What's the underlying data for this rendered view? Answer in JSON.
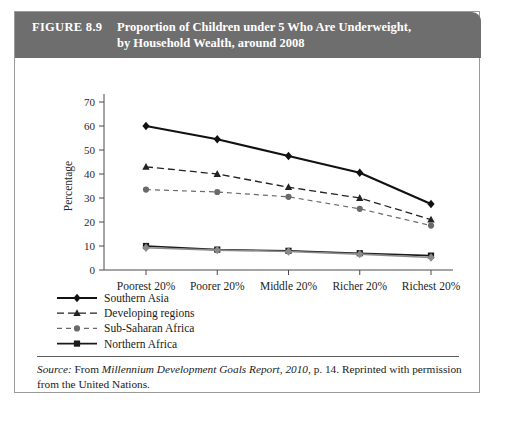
{
  "figure": {
    "number_label": "FIGURE 8.9",
    "title_line1": "Proportion of Children under 5 Who Are Underweight,",
    "title_line2": "by Household Wealth, around 2008",
    "header_bg": "#6e6e6e",
    "header_text_color": "#ffffff"
  },
  "source": {
    "prefix": "Source:",
    "text_before_italic": " From ",
    "italic_title": "Millennium Development Goals Report, 2010",
    "text_after": ", p. 14. Reprinted with permission from the United Nations."
  },
  "chart_data": {
    "type": "line",
    "title": "Proportion of Children under 5 Who Are Underweight, by Household Wealth, around 2008",
    "xlabel": "",
    "ylabel": "Percentage",
    "categories": [
      "Poorest 20%",
      "Poorer 20%",
      "Middle 20%",
      "Richer 20%",
      "Richest 20%"
    ],
    "ylim": [
      0,
      70
    ],
    "yticks": [
      0,
      10,
      20,
      30,
      40,
      50,
      60,
      70
    ],
    "ytick_labels": [
      "0",
      "10",
      "20",
      "30",
      "40",
      "50",
      "60",
      "70"
    ],
    "grid": false,
    "legend_position": "below-left",
    "series": [
      {
        "name": "Southern Asia",
        "values": [
          60,
          54.5,
          47.5,
          40.5,
          27.5
        ],
        "marker": "diamond",
        "line_style": "solid",
        "color": "#111111",
        "line_width": 2.1
      },
      {
        "name": "Developing regions",
        "values": [
          43,
          40,
          34.5,
          30,
          21
        ],
        "marker": "triangle",
        "line_style": "dashed",
        "color": "#222222",
        "line_width": 1.3
      },
      {
        "name": "Sub-Saharan Africa",
        "values": [
          33.5,
          32.5,
          30.5,
          25.5,
          18.5
        ],
        "marker": "circle",
        "line_style": "dotted-dashed",
        "color": "#6a6a6a",
        "line_width": 1.2
      },
      {
        "name": "Northern Africa",
        "values": [
          10,
          8.5,
          8,
          7,
          6
        ],
        "marker": "square",
        "line_style": "solid",
        "color": "#1a1a1a",
        "line_width": 1.6
      },
      {
        "name": "CIS, Asia",
        "values": [
          9.3,
          8.3,
          7.7,
          6.6,
          5.2
        ],
        "marker": "diamond",
        "line_style": "solid",
        "color": "#8a8a8a",
        "line_width": 1.6
      }
    ]
  }
}
